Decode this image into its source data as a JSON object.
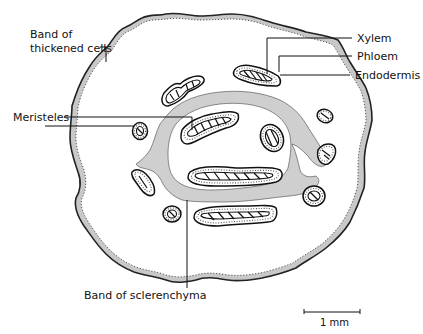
{
  "diagram": {
    "labels": {
      "band_thickened": [
        "Band of",
        "thickened cells"
      ],
      "xylem": "Xylem",
      "phloem": "Phloem",
      "endodermis": "Endodermis",
      "meristeles": "Meristeles",
      "band_sclerenchyma": "Band of sclerenchyma"
    },
    "scale_bar": {
      "label": "1 mm"
    },
    "colors": {
      "band_fill": "#c8c8c8",
      "outline": "#111111",
      "background": "#ffffff"
    }
  }
}
